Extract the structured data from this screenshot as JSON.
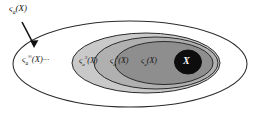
{
  "figure": {
    "background_color": "#ffffff",
    "stroke_color": "#2b2b2b",
    "annotation": {
      "label": "ς",
      "label_sub": "a",
      "label_arg": "(X)",
      "arrow": "arrow-down-right"
    },
    "regions": [
      {
        "name": "outer-region",
        "fill": "#ffffff",
        "label": "ς",
        "label_sub": "a",
        "label_sup": "∞",
        "label_arg": "(X)",
        "label_suffix": "···"
      },
      {
        "name": "region-3",
        "fill": "#c9c9c9",
        "label": "ς",
        "label_sub": "a",
        "label_sup": "3",
        "label_arg": "(X)"
      },
      {
        "name": "region-2",
        "fill": "#b0b0b0",
        "label": "ς",
        "label_sub": "a",
        "label_sup": "2",
        "label_arg": "(X)"
      },
      {
        "name": "region-1",
        "fill": "#8e8e8e",
        "label": "ς",
        "label_sub": "a",
        "label_sup": "",
        "label_arg": "(X)"
      },
      {
        "name": "region-core",
        "fill": "#0d0d0d",
        "label": "X",
        "label_color": "#ffffff"
      }
    ]
  }
}
